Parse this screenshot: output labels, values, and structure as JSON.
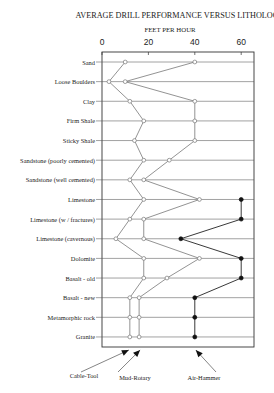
{
  "chart_data": {
    "type": "line",
    "title": "AVERAGE DRILL PERFORMANCE VERSUS LITHOLOGY",
    "xlabel": "FEET PER HOUR",
    "ylabel": "",
    "xlim": [
      0,
      65
    ],
    "x_ticks": [
      0,
      20,
      40,
      60
    ],
    "grid": "horizontal lines at each lithology",
    "orientation": "horizontal (categories on y axis, value on x axis)",
    "categories": [
      "Sand",
      "Loose Boulders",
      "Clay",
      "Firm Shale",
      "Sticky Shale",
      "Sandstone (poorly cemented)",
      "Sandstone (well cemented)",
      "Limestone",
      "Limestone (w / fractures)",
      "Limestone (cavernous)",
      "Dolomite",
      "Basalt - old",
      "Basalt - new",
      "Metamorphic rock",
      "Granite"
    ],
    "series": [
      {
        "name": "Cable-Tool",
        "marker": "open-circle",
        "values": [
          10,
          3,
          12,
          18,
          14,
          18,
          12,
          18,
          12,
          6,
          18,
          18,
          12,
          12,
          12
        ]
      },
      {
        "name": "Mud-Rotary",
        "marker": "open-circle",
        "values": [
          40,
          10,
          40,
          40,
          40,
          29,
          18,
          42,
          18,
          18,
          42,
          28,
          16,
          16,
          16
        ]
      },
      {
        "name": "Air-Hammer",
        "marker": "filled-circle",
        "values": [
          null,
          null,
          null,
          null,
          null,
          null,
          null,
          60,
          60,
          34,
          60,
          60,
          40,
          40,
          40
        ]
      }
    ],
    "legend": {
      "position": "bottom, arrow callouts",
      "entries": [
        "Cable-Tool",
        "Mud-Rotary",
        "Air-Hammer"
      ]
    }
  }
}
